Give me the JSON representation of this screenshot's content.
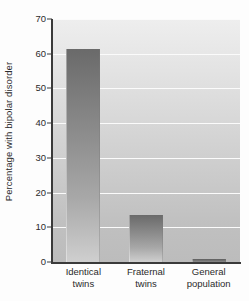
{
  "chart_data": {
    "type": "bar",
    "title": "",
    "subtitle": "",
    "xlabel": "",
    "ylabel": "Percentage with bipolar disorder",
    "categories": [
      "Identical twins",
      "Fraternal twins",
      "General population"
    ],
    "category_lines": [
      [
        "Identical",
        "twins"
      ],
      [
        "Fraternal",
        "twins"
      ],
      [
        "General",
        "population"
      ]
    ],
    "values": [
      61.5,
      13.5,
      1
    ],
    "ylim": [
      0,
      70
    ],
    "yticks": [
      0,
      10,
      20,
      30,
      40,
      50,
      60,
      70
    ],
    "ytick_labels": [
      "0",
      "10",
      "20",
      "30",
      "40",
      "50",
      "60",
      "70"
    ],
    "grid": true,
    "grid_color": "#fbfbfb",
    "legend": "none",
    "bar_color": "#8a8a8a",
    "plot_bg_top": "#eeeeee",
    "plot_bg_bottom": "#bcbcbc",
    "axis_color": "#3a3a3a",
    "text_color": "#2b2b2b"
  }
}
